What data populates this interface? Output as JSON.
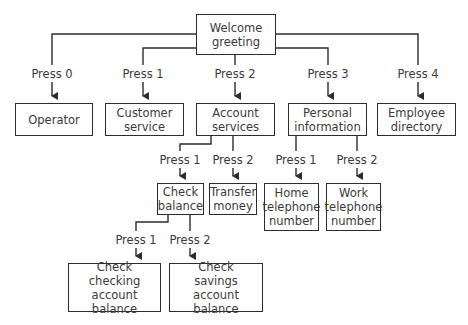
{
  "diagram": {
    "type": "phone menu tree",
    "root": {
      "label": "Welcome\ngreeting"
    },
    "level1": [
      {
        "press": "Press 0",
        "label": "Operator"
      },
      {
        "press": "Press 1",
        "label": "Customer\nservice"
      },
      {
        "press": "Press 2",
        "label": "Account\nservices"
      },
      {
        "press": "Press 3",
        "label": "Personal\ninformation"
      },
      {
        "press": "Press 4",
        "label": "Employee\ndirectory"
      }
    ],
    "account_services": [
      {
        "press": "Press 1",
        "label": "Check\nbalance"
      },
      {
        "press": "Press 2",
        "label": "Transfer\nmoney"
      }
    ],
    "personal_information": [
      {
        "press": "Press 1",
        "label": "Home\ntelephone\nnumber"
      },
      {
        "press": "Press 2",
        "label": "Work\ntelephone\nnumber"
      }
    ],
    "check_balance": [
      {
        "press": "Press 1",
        "label": "Check\nchecking\naccount balance"
      },
      {
        "press": "Press 2",
        "label": "Check\nsavings\naccount balance"
      }
    ],
    "colors": {
      "line": "#2c2c2c",
      "text": "#3a3a3a",
      "background": "#ffffff"
    }
  }
}
